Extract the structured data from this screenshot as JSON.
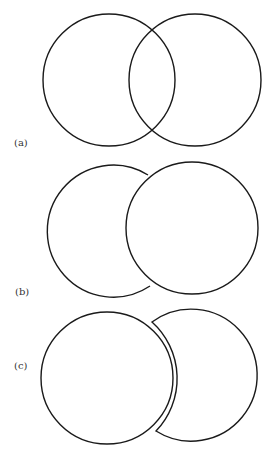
{
  "figure": {
    "panels": [
      {
        "label": "(a)",
        "description": "two overlapping circles, both outlines fully visible"
      },
      {
        "label": "(b)",
        "description": "right circle occludes the left circle"
      },
      {
        "label": "(c)",
        "description": "left circle in front; right shape shown as a crescent with a gap"
      }
    ]
  },
  "colors": {
    "stroke": "#1a1a1a",
    "background": "#ffffff"
  }
}
